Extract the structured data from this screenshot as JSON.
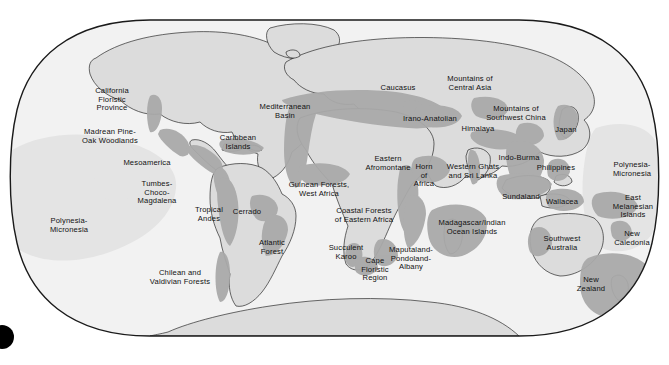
{
  "figure": {
    "kind": "world-map",
    "projection": "robinson-style-oval",
    "background_color": "#ffffff",
    "outline_color": "#1a1a1a",
    "ocean_color": "#f2f2f2",
    "land_color": "#dcdcdc",
    "hotspot_color": "#a9a9a9",
    "marine_region_color": "#e2e2e2",
    "width": 669,
    "height": 365
  },
  "corner_marker": {
    "name": "black-dot",
    "color": "#000000",
    "cx": 2,
    "cy": 337,
    "r": 12
  },
  "map_data": {
    "type": "map",
    "title": "",
    "label_count": 35,
    "labels": [
      {
        "id": "california-floristic-province",
        "text": "California\nFloristic\nProvince",
        "x": 112,
        "y": 100
      },
      {
        "id": "madrean-pine-oak-woodlands",
        "text": "Madrean Pine-\nOak Woodlands",
        "x": 110,
        "y": 137
      },
      {
        "id": "mesoamerica",
        "text": "Mesoamerica",
        "x": 147,
        "y": 163
      },
      {
        "id": "caribbean-islands",
        "text": "Caribbean\nIslands",
        "x": 238,
        "y": 143
      },
      {
        "id": "tumbes-choco-magdalena",
        "text": "Tumbes-\nChoco-\nMagdalena",
        "x": 157,
        "y": 193
      },
      {
        "id": "tropical-andes",
        "text": "Tropical\nAndes",
        "x": 209,
        "y": 215
      },
      {
        "id": "cerrado",
        "text": "Cerrado",
        "x": 247,
        "y": 212
      },
      {
        "id": "atlantic-forest",
        "text": "Atlantic\nForest",
        "x": 272,
        "y": 248
      },
      {
        "id": "chilean-and-valdivian-forests",
        "text": "Chilean and\nValdivian Forests",
        "x": 180,
        "y": 278
      },
      {
        "id": "polynesia-micronesia-east-pacific",
        "text": "Polynesia-\nMicronesia",
        "x": 69,
        "y": 226
      },
      {
        "id": "mediterranean-basin",
        "text": "Mediterranean\nBasin",
        "x": 285,
        "y": 112
      },
      {
        "id": "guinean-forests-west-africa",
        "text": "Guinean Forests,\nWest Africa",
        "x": 319,
        "y": 190
      },
      {
        "id": "eastern-afromontane",
        "text": "Eastern\nAfromontane",
        "x": 388,
        "y": 164
      },
      {
        "id": "horn-of-africa",
        "text": "Horn\nof\nAfrica",
        "x": 424,
        "y": 176
      },
      {
        "id": "coastal-forests-of-eastern-africa",
        "text": "Coastal Forests\nof Eastern Africa",
        "x": 364,
        "y": 216
      },
      {
        "id": "madagascar-indian-ocean-islands",
        "text": "Madagascar/Indian\nOcean Islands",
        "x": 472,
        "y": 228
      },
      {
        "id": "succulent-karoo",
        "text": "Succulent\nKaroo",
        "x": 346,
        "y": 253
      },
      {
        "id": "cape-floristic-region",
        "text": "Cape\nFloristic\nRegion",
        "x": 375,
        "y": 270
      },
      {
        "id": "maputaland-pondoland-albany",
        "text": "Maputaland-\nPondoland-\nAlbany",
        "x": 411,
        "y": 259
      },
      {
        "id": "caucasus",
        "text": "Caucasus",
        "x": 398,
        "y": 88
      },
      {
        "id": "irano-anatolian",
        "text": "Irano-Anatolian",
        "x": 430,
        "y": 119
      },
      {
        "id": "mountains-of-central-asia",
        "text": "Mountains of\nCentral Asia",
        "x": 470,
        "y": 84
      },
      {
        "id": "mountains-of-southwest-china",
        "text": "Mountains of\nSouthwest China",
        "x": 516,
        "y": 114
      },
      {
        "id": "himalaya",
        "text": "Himalaya",
        "x": 478,
        "y": 129
      },
      {
        "id": "western-ghats-and-sri-lanka",
        "text": "Western Ghats\nand Sri Lanka",
        "x": 473,
        "y": 172
      },
      {
        "id": "indo-burma",
        "text": "Indo-Burma",
        "x": 519,
        "y": 158
      },
      {
        "id": "philippines",
        "text": "Philippines",
        "x": 556,
        "y": 168
      },
      {
        "id": "japan",
        "text": "Japan",
        "x": 566,
        "y": 130
      },
      {
        "id": "sundaland",
        "text": "Sundaland",
        "x": 521,
        "y": 197
      },
      {
        "id": "wallacea",
        "text": "Wallacea",
        "x": 562,
        "y": 202
      },
      {
        "id": "polynesia-micronesia-west-pacific",
        "text": "Polynesia-\nMicronesia",
        "x": 632,
        "y": 170
      },
      {
        "id": "east-melanesian-islands",
        "text": "East\nMelanesian\nIslands",
        "x": 633,
        "y": 207
      },
      {
        "id": "new-caledonia",
        "text": "New\nCaledonia",
        "x": 632,
        "y": 239
      },
      {
        "id": "southwest-australia",
        "text": "Southwest\nAustralia",
        "x": 562,
        "y": 244
      },
      {
        "id": "new-zealand",
        "text": "New\nZealand",
        "x": 591,
        "y": 285
      }
    ]
  }
}
